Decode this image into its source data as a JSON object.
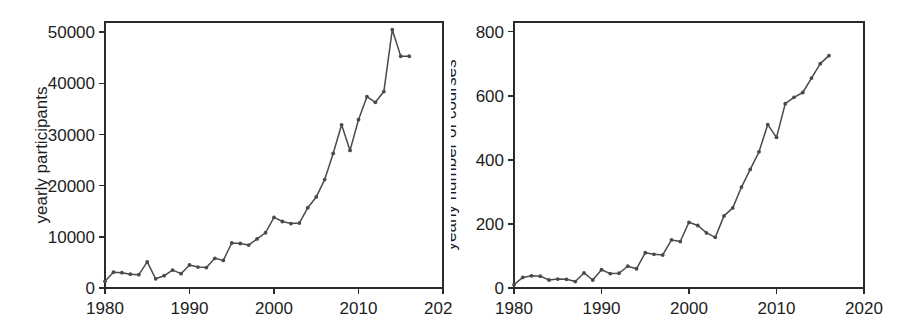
{
  "figure": {
    "background_color": "#ffffff",
    "line_color": "#4a4a4a",
    "axis_color": "#2b2b2b",
    "text_color": "#1d1d1d",
    "panel_count": 2
  },
  "chart_data": [
    {
      "id": "participants",
      "type": "line",
      "title": "",
      "xlabel": "",
      "ylabel": "yearly participants",
      "xlim": [
        1980,
        2020
      ],
      "ylim": [
        0,
        52000
      ],
      "xticks": [
        1980,
        1990,
        2000,
        2010,
        2020
      ],
      "xticklabels": [
        "1980",
        "1990",
        "2000",
        "2010",
        "2020"
      ],
      "yticks": [
        0,
        10000,
        20000,
        30000,
        40000,
        50000
      ],
      "yticklabels": [
        "0",
        "10000",
        "20000",
        "30000",
        "40000",
        "50000"
      ],
      "grid": false,
      "legend": false,
      "markers": true,
      "x": [
        1980,
        1981,
        1982,
        1983,
        1984,
        1985,
        1986,
        1987,
        1988,
        1989,
        1990,
        1991,
        1992,
        1993,
        1994,
        1995,
        1996,
        1997,
        1998,
        1999,
        2000,
        2001,
        2002,
        2003,
        2004,
        2005,
        2006,
        2007,
        2008,
        2009,
        2010,
        2011,
        2012,
        2013,
        2014,
        2015,
        2016
      ],
      "values": [
        1300,
        3100,
        3000,
        2700,
        2600,
        5100,
        1800,
        2400,
        3500,
        2800,
        4500,
        4100,
        4000,
        5800,
        5400,
        8800,
        8700,
        8400,
        9600,
        10800,
        13800,
        13000,
        12600,
        12700,
        15700,
        17800,
        21200,
        26300,
        31900,
        26900,
        32900,
        37400,
        36300,
        38400,
        50500,
        45300,
        45300
      ],
      "series_name": "yearly participants"
    },
    {
      "id": "courses",
      "type": "line",
      "title": "",
      "xlabel": "",
      "ylabel": "yearly number of courses",
      "xlim": [
        1980,
        2020
      ],
      "ylim": [
        0,
        830
      ],
      "xticks": [
        1980,
        1990,
        2000,
        2010,
        2020
      ],
      "xticklabels": [
        "1980",
        "1990",
        "2000",
        "2010",
        "2020"
      ],
      "yticks": [
        0,
        200,
        400,
        600,
        800
      ],
      "yticklabels": [
        "0",
        "200",
        "400",
        "600",
        "800"
      ],
      "grid": false,
      "legend": false,
      "markers": true,
      "x": [
        1980,
        1981,
        1982,
        1983,
        1984,
        1985,
        1986,
        1987,
        1988,
        1989,
        1990,
        1991,
        1992,
        1993,
        1994,
        1995,
        1996,
        1997,
        1998,
        1999,
        2000,
        2001,
        2002,
        2003,
        2004,
        2005,
        2006,
        2007,
        2008,
        2009,
        2010,
        2011,
        2012,
        2013,
        2014,
        2015,
        2016
      ],
      "values": [
        10,
        33,
        38,
        37,
        25,
        28,
        27,
        20,
        47,
        25,
        57,
        45,
        46,
        68,
        60,
        110,
        105,
        103,
        150,
        145,
        205,
        195,
        172,
        158,
        225,
        250,
        315,
        370,
        425,
        510,
        470,
        575,
        595,
        610,
        655,
        700,
        725
      ],
      "series_name": "yearly number of courses"
    }
  ],
  "panels": [
    {
      "name": "left-panel",
      "chart_index": 0,
      "plot_area": {
        "x": 105,
        "y": 22,
        "width": 338,
        "height": 266
      }
    },
    {
      "name": "right-panel",
      "chart_index": 1,
      "plot_area": {
        "x": 63,
        "y": 22,
        "width": 350,
        "height": 266
      }
    }
  ]
}
